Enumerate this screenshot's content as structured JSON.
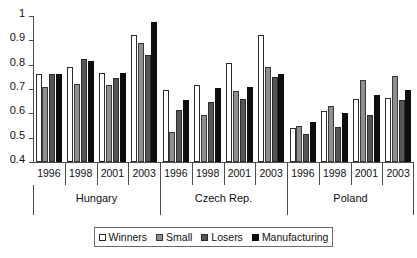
{
  "chart_data": {
    "type": "bar",
    "title": "",
    "subtitle": "",
    "xlabel": "",
    "ylabel": "",
    "ylim": [
      0.4,
      1
    ],
    "ytick_labels": [
      "1",
      "0.9",
      "0.8",
      "0.7",
      "0.6",
      "0.5",
      "0.4"
    ],
    "ytick_values": [
      1,
      0.9,
      0.8,
      0.7,
      0.6,
      0.5,
      0.4
    ],
    "grid": false,
    "legend_position": "bottom",
    "categories": [
      "1996",
      "1998",
      "2001",
      "2003"
    ],
    "groups": [
      "Hungary",
      "Czech Rep.",
      "Poland"
    ],
    "series": [
      {
        "name": "Winners",
        "color": "#ffffff",
        "values": {
          "Hungary": [
            0.76,
            0.79,
            0.765,
            0.92
          ],
          "Czech Rep.": [
            0.695,
            0.715,
            0.805,
            0.92
          ],
          "Poland": [
            0.54,
            0.61,
            0.66,
            0.665
          ]
        }
      },
      {
        "name": "Small",
        "color": "#8f8f8f",
        "values": {
          "Hungary": [
            0.71,
            0.72,
            0.715,
            0.89
          ],
          "Czech Rep.": [
            0.525,
            0.595,
            0.69,
            0.79
          ],
          "Poland": [
            0.55,
            0.63,
            0.735,
            0.755
          ]
        }
      },
      {
        "name": "Losers",
        "color": "#555555",
        "values": {
          "Hungary": [
            0.76,
            0.825,
            0.745,
            0.84
          ],
          "Czech Rep.": [
            0.615,
            0.645,
            0.66,
            0.75
          ],
          "Poland": [
            0.515,
            0.545,
            0.595,
            0.655
          ]
        }
      },
      {
        "name": "Manufacturing",
        "color": "#0d0d0d",
        "values": {
          "Hungary": [
            0.76,
            0.815,
            0.765,
            0.975
          ],
          "Czech Rep.": [
            0.655,
            0.705,
            0.71,
            0.76
          ],
          "Poland": [
            0.565,
            0.6,
            0.675,
            0.695
          ]
        }
      }
    ]
  },
  "legend": {
    "items": [
      {
        "label": "Winners",
        "key": "winners"
      },
      {
        "label": "Small",
        "key": "small"
      },
      {
        "label": "Losers",
        "key": "losers"
      },
      {
        "label": "Manufacturing",
        "key": "manufacturing"
      }
    ]
  }
}
